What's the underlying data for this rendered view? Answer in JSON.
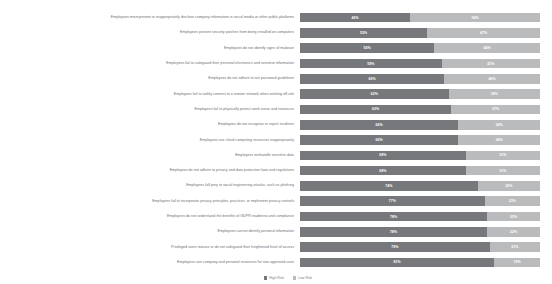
{
  "chart_data": {
    "type": "bar",
    "subtype": "stacked-horizontal-100-percent",
    "title": "",
    "xlabel": "",
    "ylabel": "",
    "xlim": [
      0,
      100
    ],
    "grid": false,
    "legend_position": "bottom-center",
    "categories": [
      "Employees misrepresent or inappropriately disclose company information in social media or other public platforms",
      "Employees prevent security patches from being installed on computers",
      "Employees do not identify signs of malware",
      "Employees fail to safeguard their personal electronics and sensitive information",
      "Employees do not adhere to our password guidelines",
      "Employees fail to safely connect to a remote network when working off-site",
      "Employees fail to physically protect work areas and resources",
      "Employees do not recognize or report incidents",
      "Employees use cloud computing resources inappropriately",
      "Employees mishandle sensitive data",
      "Employees do not adhere to privacy and data protection laws and regulations",
      "Employees fall prey to social engineering attacks, such as phishing",
      "Employees fail to incorporate privacy principles, practices, or implement privacy controls",
      "Employees do not understand the benefits of GDPR readiness and compliance",
      "Employees cannot identify personal information",
      "Privileged users misuse or do not safeguard their heightened level of access",
      "Employees use company and personal resources for non-approved uses"
    ],
    "series": [
      {
        "name": "High Risk",
        "color": "#76787b",
        "values": [
          46,
          53,
          56,
          59,
          60,
          62,
          63,
          66,
          66,
          69,
          69,
          74,
          77,
          78,
          78,
          79,
          81
        ],
        "labels": [
          "46%",
          "53%",
          "56%",
          "59%",
          "60%",
          "62%",
          "63%",
          "66%",
          "66%",
          "69%",
          "69%",
          "74%",
          "77%",
          "78%",
          "78%",
          "79%",
          "81%"
        ]
      },
      {
        "name": "Low Risk",
        "color": "#b9bbbd",
        "values": [
          54,
          47,
          44,
          41,
          40,
          38,
          37,
          34,
          34,
          31,
          31,
          26,
          23,
          22,
          22,
          21,
          19
        ],
        "labels": [
          "54%",
          "47%",
          "44%",
          "41%",
          "40%",
          "38%",
          "37%",
          "34%",
          "34%",
          "31%",
          "31%",
          "26%",
          "23%",
          "22%",
          "22%",
          "21%",
          "19%"
        ]
      }
    ]
  },
  "legend": {
    "items": [
      {
        "label": "High Risk"
      },
      {
        "label": "Low Risk"
      }
    ]
  },
  "colors": {
    "high_risk": "#76787b",
    "low_risk": "#b9bbbd",
    "label_text": "#6d6e71",
    "value_text": "#ffffff",
    "background": "#ffffff"
  }
}
